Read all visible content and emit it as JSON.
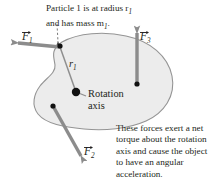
{
  "figure": {
    "name": "rigid-body-torque-diagram",
    "background_color": "#ffffff",
    "body_fill_color": "#ececec",
    "body_stroke_color": "#8a8a8a",
    "arrow_color": "#8c8c8c",
    "text_color": "#231f20",
    "dot_color": "#111111"
  },
  "captions": {
    "particle": {
      "line1": "Particle 1 is at radius r",
      "line1_sub": "1",
      "line2": "and has mass m",
      "line2_sub": "1",
      "line2_end": "."
    },
    "torque": {
      "line1": "These forces exert a net",
      "line2": "torque about the rotation",
      "line3": "axis and cause the object",
      "line4": "to have an angular",
      "line5": "acceleration."
    }
  },
  "labels": {
    "rotation_axis_line1": "Rotation",
    "rotation_axis_line2": "axis",
    "radius": "r",
    "radius_sub": "1"
  },
  "vectors": [
    {
      "id": "f1",
      "symbol": "F",
      "subscript": "1",
      "direction": "left"
    },
    {
      "id": "f2",
      "symbol": "F",
      "subscript": "2",
      "direction": "down-left"
    },
    {
      "id": "f3",
      "symbol": "F",
      "subscript": "3",
      "direction": "up"
    }
  ]
}
